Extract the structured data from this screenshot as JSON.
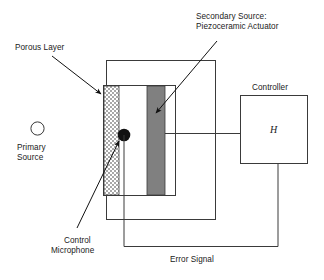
{
  "figure": {
    "type": "schematic-diagram",
    "background_color": "#ffffff",
    "line_color": "#3a3a3a",
    "text_color": "#1a1a1a"
  },
  "labels": {
    "porous_layer": "Porous Layer",
    "secondary_source_line1": "Secondary Source:",
    "secondary_source_line2": "Piezoceramic Actuator",
    "controller": "Controller",
    "controller_symbol": "H",
    "primary_source_line1": "Primary",
    "primary_source_line2": "Source",
    "control_microphone_line1": "Control",
    "control_microphone_line2": "Microphone",
    "error_signal": "Error Signal"
  },
  "elements": {
    "primary_source_marker": "open-circle",
    "control_microphone_marker": "filled-dot",
    "porous_layer_fill": "stippled-gray",
    "actuator_fill": "#808080",
    "duct_fill": "#ffffff"
  },
  "colors": {
    "actuator": "#808080",
    "porous_layer": "#c9c9c9",
    "stroke": "#3a3a3a",
    "text": "#1a1a1a"
  },
  "connections": [
    "actuator-to-controller",
    "microphone-to-controller-error-signal"
  ]
}
